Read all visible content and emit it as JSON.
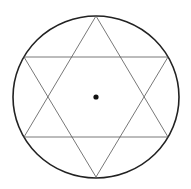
{
  "diagram": {
    "type": "hexagram-in-circle",
    "background": "#ffffff",
    "circle": {
      "cx": 96,
      "cy": 97,
      "rx": 83,
      "ry": 81,
      "stroke": "#222222",
      "stroke_width": 1.6
    },
    "triangle_up": {
      "points": "96,16 24,137 168,137",
      "stroke": "#555555",
      "stroke_width": 0.8
    },
    "triangle_down": {
      "points": "96,177 24,57 168,57",
      "stroke": "#555555",
      "stroke_width": 0.8
    },
    "center_dot": {
      "cx": 96,
      "cy": 97,
      "r": 2.6,
      "fill": "#111111"
    }
  }
}
